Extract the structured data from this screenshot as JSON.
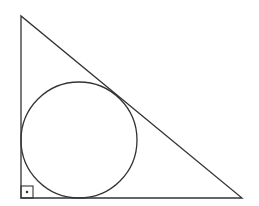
{
  "diagram": {
    "type": "geometry",
    "stroke_color": "#333333",
    "background": "#ffffff",
    "triangle": {
      "vertices": [
        [
          21,
          16
        ],
        [
          21,
          198
        ],
        [
          242,
          198
        ]
      ],
      "right_angle_vertex": [
        21,
        198
      ]
    },
    "incircle": {
      "cx": 79,
      "cy": 140,
      "r": 58
    },
    "right_angle_marker": {
      "x": 21,
      "y": 186,
      "size": 12,
      "dot": [
        27,
        192
      ]
    }
  }
}
